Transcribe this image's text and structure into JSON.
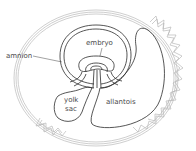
{
  "diagram": {
    "type": "biological-cross-section",
    "labels": [
      {
        "id": "embryo",
        "text": "embryo"
      },
      {
        "id": "amnion",
        "text": "amnion"
      },
      {
        "id": "yolk_sac",
        "line1": "yolk",
        "line2": "sac"
      },
      {
        "id": "allantois",
        "text": "allantois"
      }
    ],
    "colors": {
      "outer_membranes": "#b9b9b9",
      "inner_structures": "#2b2b2b",
      "label_text": "#4a4a4a"
    }
  }
}
